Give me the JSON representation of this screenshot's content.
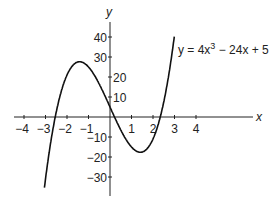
{
  "chart_data": {
    "type": "line",
    "title": "",
    "equation": "y = 4x^3 - 24x + 5",
    "annotation": {
      "prefix": "y = 4x",
      "exp": "3",
      "suffix": " − 24x + 5"
    },
    "xlabel": "x",
    "ylabel": "y",
    "xlim": [
      -4.5,
      4.5
    ],
    "ylim": [
      -35,
      45
    ],
    "x_ticks": [
      "-4",
      "-3",
      "-2",
      "-1",
      "1",
      "2",
      "3",
      "4"
    ],
    "x_tick_values": [
      -4,
      -3,
      -2,
      -1,
      1,
      2,
      3,
      4
    ],
    "y_ticks": [
      "40",
      "30",
      "20",
      "10",
      "-10",
      "-20",
      "-30"
    ],
    "y_tick_values": [
      40,
      30,
      20,
      10,
      -10,
      -20,
      -30
    ],
    "grid": false,
    "series": [
      {
        "name": "y = 4x^3 - 24x + 5",
        "x": [
          -3.05,
          -2.5,
          -2,
          -1.5,
          -1.41,
          -1,
          -0.5,
          0,
          0.5,
          1,
          1.41,
          1.5,
          2,
          2.5,
          3
        ],
        "y": [
          -35.3,
          -2.5,
          21,
          27.5,
          27.6,
          25,
          16.5,
          5,
          -6.5,
          -15,
          -17.6,
          -17.5,
          -11,
          10.5,
          41
        ]
      }
    ]
  }
}
